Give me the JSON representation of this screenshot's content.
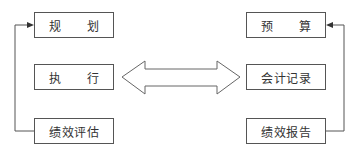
{
  "diagram": {
    "left_column": [
      {
        "label": "规　　划"
      },
      {
        "label": "执　　行"
      },
      {
        "label": "绩效评估"
      }
    ],
    "right_column": [
      {
        "label": "预　　算"
      },
      {
        "label": "会计记录"
      },
      {
        "label": "绩效报告"
      }
    ],
    "connector": "double-arrow",
    "colors": {
      "line": "#555555",
      "text": "#333333",
      "background": "#ffffff"
    }
  }
}
